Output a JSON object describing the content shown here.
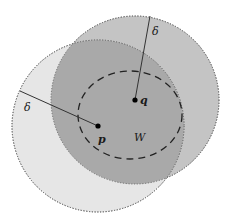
{
  "diagram": {
    "title": "",
    "colors": {
      "background": "#ffffff",
      "circle_p_fill": "#e6e6e6",
      "circle_q_fill": "#c4c4c4",
      "intersection_fill": "#a9a9a9",
      "outline": "#7a7a7a",
      "line": "#333333",
      "dashed": "#222222",
      "point": "#000000"
    },
    "circle_p": {
      "cx": 98,
      "cy": 126,
      "r": 86
    },
    "circle_q": {
      "cx": 135,
      "cy": 100,
      "r": 84
    },
    "region_w": {
      "cx": 130,
      "cy": 115,
      "rx": 52,
      "ry": 44
    },
    "points": [
      {
        "id": "p",
        "label": "p",
        "x": 98,
        "y": 126
      },
      {
        "id": "q",
        "label": "q",
        "x": 135,
        "y": 100
      }
    ],
    "radius_lines": [
      {
        "from": "p",
        "x1": 98,
        "y1": 126,
        "x2": 20,
        "y2": 91,
        "label": "δ"
      },
      {
        "from": "q",
        "x1": 135,
        "y1": 100,
        "x2": 150,
        "y2": 16,
        "label": "δ"
      }
    ],
    "labels": {
      "p": "p",
      "q": "q",
      "w": "W",
      "delta_left": "δ",
      "delta_top": "δ"
    }
  }
}
